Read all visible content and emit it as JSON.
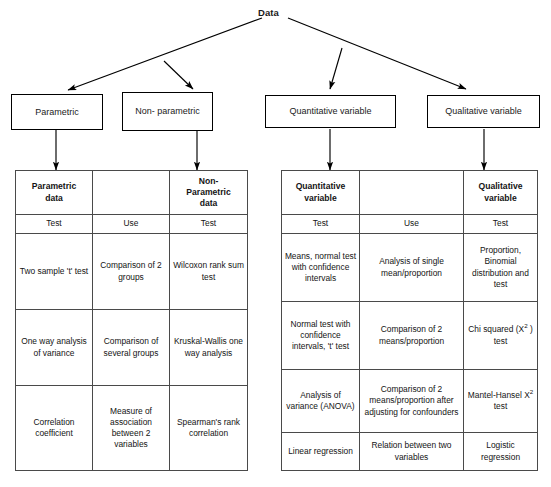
{
  "diagram": {
    "root": {
      "label": "Data"
    },
    "nodes": [
      {
        "id": "parametric",
        "label": "Parametric"
      },
      {
        "id": "nonparametric",
        "label": "Non- parametric"
      },
      {
        "id": "quantitative",
        "label": "Quantitative variable"
      },
      {
        "id": "qualitative",
        "label": "Qualitative variable"
      }
    ],
    "left_table": {
      "headers": [
        "Parametric data",
        "",
        "Non- Parametric data"
      ],
      "headers_lines": [
        [
          "Parametric",
          "data"
        ],
        [
          ""
        ],
        [
          "Non-",
          "Parametric",
          "data"
        ]
      ],
      "subheaders": [
        "Test",
        "Use",
        "Test"
      ],
      "rows": [
        [
          "Two sample 't' test",
          "Comparison of 2 groups",
          "Wilcoxon rank sum test"
        ],
        [
          "One way analysis of variance",
          "Comparison of several groups",
          "Kruskal-Wallis one way analysis"
        ],
        [
          "Correlation coefficient",
          "Measure of association between 2 variables",
          "Spearman's rank correlation"
        ]
      ]
    },
    "right_table": {
      "headers": [
        "Quantitative variable",
        "",
        "Qualitative variable"
      ],
      "headers_lines": [
        [
          "Quantitative",
          "variable"
        ],
        [
          ""
        ],
        [
          "Qualitative",
          "variable"
        ]
      ],
      "subheaders": [
        "Test",
        "Use",
        "Test"
      ],
      "rows": [
        [
          "Means, normal test with confidence intervals",
          "Analysis of single mean/proportion",
          "Proportion, Binomial distribution and test"
        ],
        [
          "Normal test with confidence intervals, 't' test",
          "Comparison of 2 means/proportion",
          "Chi squared (X² ) test"
        ],
        [
          "Analysis of variance (ANOVA)",
          "Comparison of 2 means/proportion after adjusting for confounders",
          "Mantel-Hansel X² test"
        ],
        [
          "Linear regression",
          "Relation between two variables",
          "Logistic regression"
        ]
      ]
    },
    "colors": {
      "line": "#000000",
      "border": "#3a3a3a",
      "cell_border": "#4a4a4a",
      "text": "#141414",
      "background": "#ffffff"
    }
  }
}
